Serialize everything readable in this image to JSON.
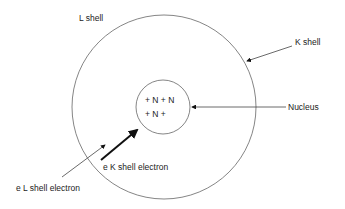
{
  "diagram": {
    "labels": {
      "l_shell": "L shell",
      "k_shell": "K shell",
      "nucleus": "Nucleus",
      "nucleus_row1": "+ N + N",
      "nucleus_row2": "+ N +",
      "k_electron": "e K shell electron",
      "l_electron": "e L shell electron"
    },
    "colors": {
      "line": "#555555",
      "text": "#222222",
      "background": "#ffffff"
    }
  }
}
